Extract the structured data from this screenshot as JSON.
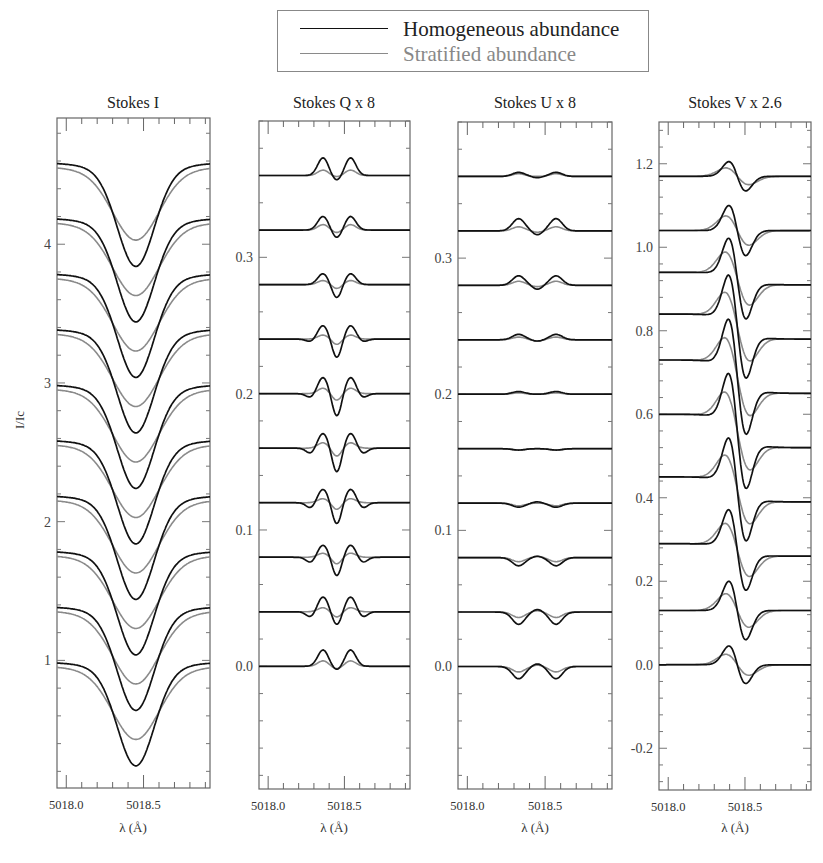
{
  "legend": {
    "items": [
      {
        "label": "Homogeneous abundance",
        "color": "#111111",
        "text_color": "#222222",
        "style": "solid-black"
      },
      {
        "label": "Stratified abundance",
        "color": "#8a8a8a",
        "text_color": "#888888",
        "style": "solid-gray"
      }
    ]
  },
  "y_axis_label": "I/Ic",
  "x_axis_label": "λ (Å)",
  "chart_data": [
    {
      "type": "line",
      "title": "Stokes I",
      "xlabel": "λ (Å)",
      "ylabel": "I/Ic",
      "xlim": [
        5017.94,
        5018.93
      ],
      "xticks": [
        5018.0,
        5018.5
      ],
      "ylim": [
        0.08,
        4.91
      ],
      "yticks": [
        1,
        2,
        3,
        4
      ],
      "ytick_labels": [
        "1",
        "2",
        "3",
        "4"
      ],
      "line_center": 5018.45,
      "offsets": [
        1.0,
        1.4,
        1.8,
        2.2,
        2.6,
        3.0,
        3.4,
        3.8,
        4.2,
        4.6
      ],
      "series": [
        {
          "name": "Homogeneous abundance",
          "continuum": 1.0,
          "line_min": 0.24,
          "width_A": 0.12
        },
        {
          "name": "Stratified abundance",
          "continuum": 0.97,
          "line_min": 0.43,
          "width_A": 0.15
        }
      ],
      "note": "10 profiles vertically offset by 0.4; homogeneous profiles deeper/narrower than stratified"
    },
    {
      "type": "line",
      "title": "Stokes Q x 8",
      "xlabel": "λ (Å)",
      "ylabel": "",
      "xlim": [
        5017.94,
        5018.93
      ],
      "xticks": [
        5018.0,
        5018.5
      ],
      "ylim": [
        -0.09,
        0.4
      ],
      "yticks": [
        0.0,
        0.1,
        0.2,
        0.3
      ],
      "ytick_labels": [
        "0.0",
        "0.1",
        "0.2",
        "0.3"
      ],
      "line_center": 5018.45,
      "offsets": [
        0.0,
        0.04,
        0.08,
        0.12,
        0.16,
        0.2,
        0.24,
        0.28,
        0.32,
        0.36
      ],
      "series": [
        {
          "name": "Homogeneous abundance",
          "sigma_amp": [
            0.012,
            0.011,
            0.009,
            0.01,
            0.011,
            0.012,
            0.01,
            0.008,
            0.01,
            0.013
          ],
          "pi_amp": [
            0.003,
            0.01,
            0.014,
            0.016,
            0.018,
            0.017,
            0.014,
            0.01,
            0.006,
            0.004
          ],
          "wing_amp": [
            0.0,
            0.004,
            0.004,
            0.004,
            0.004,
            0.003,
            0.002,
            0.0,
            0.0,
            0.0
          ]
        },
        {
          "name": "Stratified abundance",
          "sigma_amp": [
            0.004,
            0.003,
            0.003,
            0.003,
            0.004,
            0.004,
            0.003,
            0.003,
            0.004,
            0.004
          ],
          "pi_amp": [
            0.002,
            0.004,
            0.005,
            0.005,
            0.006,
            0.005,
            0.004,
            0.003,
            0.002,
            0.001
          ],
          "wing_amp": [
            0.0,
            0.0,
            0.0,
            0.0,
            0.0,
            0.0,
            0.0,
            0.0,
            0.0,
            0.0
          ]
        }
      ]
    },
    {
      "type": "line",
      "title": "Stokes U x 8",
      "xlabel": "λ (Å)",
      "ylabel": "",
      "xlim": [
        5017.94,
        5018.93
      ],
      "xticks": [
        5018.0,
        5018.5
      ],
      "ylim": [
        -0.09,
        0.4
      ],
      "yticks": [
        0.0,
        0.1,
        0.2,
        0.3
      ],
      "ytick_labels": [
        "0.0",
        "0.1",
        "0.2",
        "0.3"
      ],
      "line_center": 5018.45,
      "offsets": [
        0.0,
        0.04,
        0.08,
        0.12,
        0.16,
        0.2,
        0.24,
        0.28,
        0.32,
        0.36
      ],
      "series": [
        {
          "name": "Homogeneous abundance",
          "sigma_amp": [
            -0.009,
            -0.009,
            -0.006,
            -0.003,
            -0.001,
            0.002,
            0.004,
            0.007,
            0.009,
            0.003
          ],
          "pi_amp": [
            -0.002,
            -0.002,
            -0.001,
            -0.001,
            0.0,
            0.0,
            0.001,
            0.003,
            0.003,
            0.001
          ]
        },
        {
          "name": "Stratified abundance",
          "sigma_amp": [
            -0.004,
            -0.004,
            -0.003,
            -0.002,
            -0.001,
            0.001,
            0.002,
            0.003,
            0.003,
            0.002
          ],
          "pi_amp": [
            -0.001,
            -0.001,
            -0.001,
            0.0,
            0.0,
            0.0,
            0.001,
            0.001,
            0.001,
            0.0
          ]
        }
      ]
    },
    {
      "type": "line",
      "title": "Stokes V x 2.6",
      "xlabel": "λ (Å)",
      "ylabel": "",
      "xlim": [
        5017.94,
        5018.93
      ],
      "xticks": [
        5018.0,
        5018.5
      ],
      "ylim": [
        -0.3,
        1.3
      ],
      "yticks": [
        -0.2,
        0.0,
        0.2,
        0.4,
        0.6,
        0.8,
        1.0,
        1.2
      ],
      "ytick_labels": [
        "-0.2",
        "0.0",
        "0.2",
        "0.4",
        "0.6",
        "0.8",
        "1.0",
        "1.2"
      ],
      "line_center": 5018.45,
      "offsets": [
        0.0,
        0.13,
        0.26,
        0.39,
        0.52,
        0.65,
        0.78,
        0.91,
        1.04,
        1.17
      ],
      "series": [
        {
          "name": "Homogeneous abundance",
          "amp": [
            0.045,
            0.07,
            0.09,
            0.11,
            0.12,
            0.12,
            0.11,
            0.09,
            0.06,
            0.035
          ],
          "step": [
            0.0,
            0.0,
            0.03,
            0.06,
            0.08,
            0.08,
            0.06,
            0.03,
            0.0,
            0.0
          ]
        },
        {
          "name": "Stratified abundance",
          "amp": [
            0.025,
            0.04,
            0.055,
            0.065,
            0.07,
            0.07,
            0.065,
            0.055,
            0.035,
            0.02
          ],
          "step": [
            0.0,
            0.0,
            0.03,
            0.06,
            0.08,
            0.08,
            0.06,
            0.03,
            0.0,
            0.0
          ]
        }
      ]
    }
  ]
}
